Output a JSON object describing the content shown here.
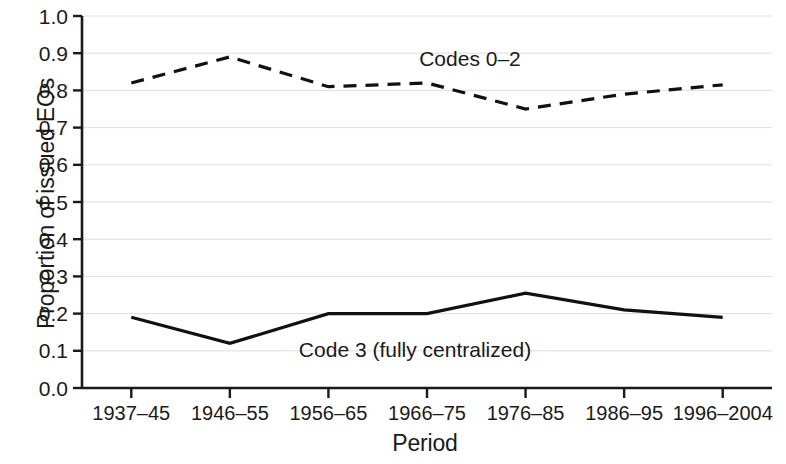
{
  "chart_data": {
    "type": "line",
    "title": "",
    "xlabel": "Period",
    "ylabel": "Proportion of issued EOs",
    "categories": [
      "1937–45",
      "1946–55",
      "1956–65",
      "1966–75",
      "1976–85",
      "1986–95",
      "1996–2004"
    ],
    "ylim": [
      0.0,
      1.0
    ],
    "ytick_labels": [
      "0.0",
      "0.1",
      "0.2",
      "0.3",
      "0.4",
      "0.5",
      "0.6",
      "0.7",
      "0.8",
      "0.9",
      "1.0"
    ],
    "ytick_values": [
      0.0,
      0.1,
      0.2,
      0.3,
      0.4,
      0.5,
      0.6,
      0.7,
      0.8,
      0.9,
      1.0
    ],
    "grid": true,
    "legend_position": "inline-annotation",
    "series": [
      {
        "name": "Codes 0–2",
        "style": "dashed",
        "color": "#111111",
        "values": [
          0.82,
          0.89,
          0.81,
          0.82,
          0.75,
          0.79,
          0.815
        ],
        "annotation": "Codes 0–2"
      },
      {
        "name": "Code 3 (fully centralized)",
        "style": "solid",
        "color": "#111111",
        "values": [
          0.19,
          0.12,
          0.2,
          0.2,
          0.255,
          0.21,
          0.19
        ],
        "annotation": "Code 3 (fully centralized)"
      }
    ]
  },
  "annotations": {
    "codes_0_2": "Codes 0–2",
    "code_3": "Code 3 (fully centralized)"
  },
  "axes": {
    "x_title": "Period",
    "y_title": "Proportion of issued EOs"
  }
}
